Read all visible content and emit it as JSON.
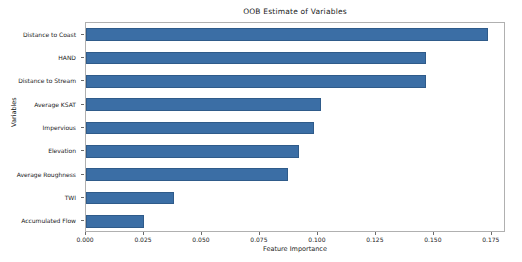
{
  "chart_data": {
    "type": "bar",
    "orientation": "horizontal",
    "title": "OOB Estimate of Variables",
    "xlabel": "Feature Importance",
    "ylabel": "Variables",
    "categories": [
      "Distance to Coast",
      "HAND",
      "Distance to Stream",
      "Average KSAT",
      "Impervious",
      "Elevation",
      "Average Roughness",
      "TWI",
      "Accumulated Flow"
    ],
    "values": [
      0.1735,
      0.1465,
      0.1465,
      0.1013,
      0.0983,
      0.0918,
      0.0871,
      0.0379,
      0.025
    ],
    "xlim": [
      0.0,
      0.1811
    ],
    "xticks": [
      0.0,
      0.025,
      0.05,
      0.075,
      0.1,
      0.125,
      0.15,
      0.175
    ],
    "xticklabels": [
      "0.000",
      "0.025",
      "0.050",
      "0.075",
      "0.100",
      "0.125",
      "0.150",
      "0.175"
    ],
    "grid": false,
    "legend": null,
    "bar_color": "#3b6ea5",
    "background_color": "#ffffff",
    "frame_color": "#b0b0b0"
  }
}
